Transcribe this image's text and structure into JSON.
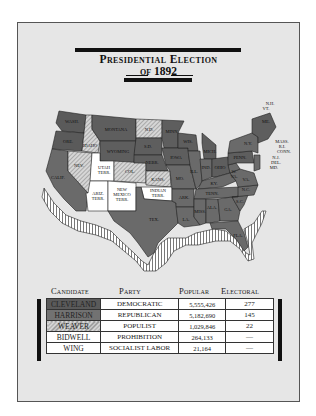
{
  "title": {
    "line1": "Presidential Election",
    "line2": "of 1892"
  },
  "colors": {
    "frame_bg": "#e6e6e6",
    "cleveland": "#5a5a5a",
    "harrison": "#727272",
    "weaver_hatch": "#8d8d8d",
    "territory": "#ffffff"
  },
  "map": {
    "labels": [
      {
        "id": "wash",
        "text": "WASH."
      },
      {
        "id": "ore",
        "text": "ORE."
      },
      {
        "id": "calif",
        "text": "CALIF."
      },
      {
        "id": "nev",
        "text": "NEV."
      },
      {
        "id": "idaho",
        "text": "IDAHO"
      },
      {
        "id": "montana",
        "text": "MONTANA"
      },
      {
        "id": "wyoming",
        "text": "WYOMING"
      },
      {
        "id": "utah",
        "text": "UTAH"
      },
      {
        "id": "utah2",
        "text": "TERR."
      },
      {
        "id": "col",
        "text": "COL."
      },
      {
        "id": "ariz",
        "text": "ARIZ."
      },
      {
        "id": "ariz2",
        "text": "TERR."
      },
      {
        "id": "nm1",
        "text": "NEW"
      },
      {
        "id": "nm2",
        "text": "MEXICO"
      },
      {
        "id": "nm3",
        "text": "TERR."
      },
      {
        "id": "nd",
        "text": "N.D."
      },
      {
        "id": "sd",
        "text": "S.D."
      },
      {
        "id": "nebr",
        "text": "NEBR."
      },
      {
        "id": "kans",
        "text": "KANS."
      },
      {
        "id": "ind1",
        "text": "INDIAN"
      },
      {
        "id": "ind2",
        "text": "TERR."
      },
      {
        "id": "tex",
        "text": "TEX."
      },
      {
        "id": "minn",
        "text": "MINN."
      },
      {
        "id": "iowa",
        "text": "IOWA"
      },
      {
        "id": "mo",
        "text": "MO."
      },
      {
        "id": "ark",
        "text": "ARK."
      },
      {
        "id": "la",
        "text": "LA."
      },
      {
        "id": "wis",
        "text": "WIS."
      },
      {
        "id": "ill",
        "text": "ILL."
      },
      {
        "id": "mich",
        "text": "MICH."
      },
      {
        "id": "ind",
        "text": "IND."
      },
      {
        "id": "ohio",
        "text": "OHIO"
      },
      {
        "id": "ky",
        "text": "KY."
      },
      {
        "id": "tenn",
        "text": "TENN."
      },
      {
        "id": "miss",
        "text": "MISS."
      },
      {
        "id": "ala",
        "text": "ALA."
      },
      {
        "id": "ga",
        "text": "GA."
      },
      {
        "id": "fla",
        "text": "FLA."
      },
      {
        "id": "sc",
        "text": "S.C."
      },
      {
        "id": "nc",
        "text": "N.C."
      },
      {
        "id": "va",
        "text": "VA."
      },
      {
        "id": "wva1",
        "text": "W."
      },
      {
        "id": "wva2",
        "text": "VA."
      },
      {
        "id": "penn",
        "text": "PENN."
      },
      {
        "id": "ny",
        "text": "N.Y."
      },
      {
        "id": "me",
        "text": "ME."
      },
      {
        "id": "nh",
        "text": "N.H."
      },
      {
        "id": "vt",
        "text": "VT."
      },
      {
        "id": "mass",
        "text": "MASS."
      },
      {
        "id": "ri",
        "text": "R.I."
      },
      {
        "id": "conn",
        "text": "CONN."
      },
      {
        "id": "nj",
        "text": "N.J."
      },
      {
        "id": "del",
        "text": "DEL."
      },
      {
        "id": "md",
        "text": "MD."
      }
    ]
  },
  "results": {
    "headers": {
      "candidate": "Candidate",
      "party": "Party",
      "popular": "Popular",
      "electoral": "Electoral"
    },
    "rows": [
      {
        "candidate": "CLEVELAND",
        "party": "DEMOCRATIC",
        "popular": "5,555,426",
        "electoral": "277",
        "swatch": "cleveland"
      },
      {
        "candidate": "HARRISON",
        "party": "REPUBLICAN",
        "popular": "5,182,690",
        "electoral": "145",
        "swatch": "harrison"
      },
      {
        "candidate": "WEAVER",
        "party": "POPULIST",
        "popular": "1,029,846",
        "electoral": "22",
        "swatch": "weaver"
      },
      {
        "candidate": "BIDWELL",
        "party": "PROHIBITION",
        "popular": "264,133",
        "electoral": "—",
        "swatch": "white"
      },
      {
        "candidate": "WING",
        "party": "SOCIALIST LABOR",
        "popular": "21,164",
        "electoral": "—",
        "swatch": "white"
      }
    ]
  }
}
